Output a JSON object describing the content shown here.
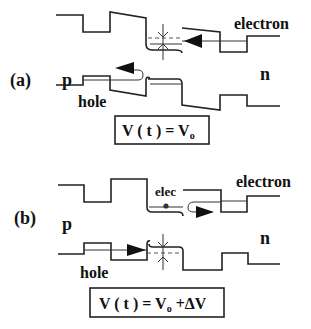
{
  "panels": [
    {
      "id": "a",
      "panel_label": "(a)",
      "region_p": "p",
      "region_n": "n",
      "carrier_top": "electron",
      "carrier_bottom": "hole",
      "formula": {
        "lhs": "V ( t ) = V",
        "sub": "o",
        "rhs": ""
      }
    },
    {
      "id": "b",
      "panel_label": "(b)",
      "region_p": "p",
      "region_n": "n",
      "carrier_top": "electron",
      "carrier_bottom": "hole",
      "annotation": "elec",
      "formula": {
        "lhs": "V ( t ) = V",
        "sub": "o",
        "rhs": " +ΔV"
      }
    }
  ],
  "colors": {
    "line": "#222222",
    "background": "#ffffff"
  }
}
